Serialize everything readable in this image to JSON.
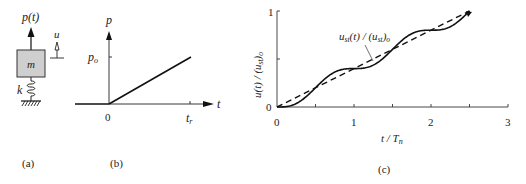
{
  "panels": {
    "a": {
      "caption": "(a)",
      "force_label": "p(t)",
      "mass_label": "m",
      "spring_label": "k",
      "displacement_label": "u",
      "mass_fill": "#cfcfcf"
    },
    "b": {
      "caption": "(b)",
      "y_axis_label": "p",
      "x_axis_label": "t",
      "origin_label": "0",
      "level_label_main": "p",
      "level_label_sub": "o",
      "time_label_main": "t",
      "time_label_sub": "r"
    },
    "c": {
      "caption": "(c)",
      "annotation": {
        "main1": "u",
        "sub1": "st",
        "mid": "(t) / (u",
        "sub2": "st",
        "end": ")",
        "sub3": "o"
      }
    }
  },
  "chart_data": {
    "type": "line",
    "title": "",
    "xlabel": "t / T_n",
    "ylabel": "u(t) / (u_st)_o",
    "xlim": [
      0,
      3
    ],
    "ylim": [
      0,
      1
    ],
    "x_ticks": [
      "0",
      "1",
      "2",
      "3"
    ],
    "y_ticks": [
      "0",
      "1"
    ],
    "grid": false,
    "tr_over_Tn": 2.5,
    "series": [
      {
        "name": "u(t) / (u_st)_o",
        "style": "solid",
        "x": [
          0,
          0.25,
          0.5,
          0.75,
          1.0,
          1.25,
          1.5,
          1.75,
          2.0,
          2.25,
          2.5
        ],
        "values": [
          0,
          0.036,
          0.2,
          0.364,
          0.4,
          0.436,
          0.6,
          0.764,
          0.8,
          0.836,
          1.0
        ]
      },
      {
        "name": "u_st(t) / (u_st)_o",
        "style": "dashed",
        "x": [
          0,
          2.5
        ],
        "values": [
          0,
          1.0
        ]
      }
    ]
  },
  "chart_labels": {
    "x_tick_0": "0",
    "x_tick_1": "1",
    "x_tick_2": "2",
    "x_tick_3": "3",
    "y_tick_0": "0",
    "y_tick_1": "1",
    "xlabel_main": "t / T",
    "xlabel_sub": "n",
    "ylabel_text": "u(t) / (u",
    "ylabel_sub1": "st",
    "ylabel_end": ")",
    "ylabel_sub2": "o"
  }
}
